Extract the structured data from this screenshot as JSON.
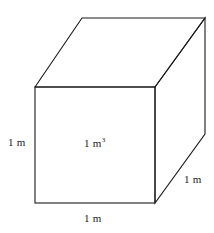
{
  "figure": {
    "kind": "cube-diagram",
    "background_color": "#ffffff",
    "stroke_color": "#1a1a1a",
    "stroke_width": 1.1,
    "fill_color": "none",
    "width": 214,
    "height": 233
  },
  "labels": {
    "left_edge": "1 m",
    "bottom_edge": "1 m",
    "right_edge": "1 m",
    "volume_value": "1 m",
    "volume_exponent": "3"
  },
  "geometry": {
    "front_top_left": [
      35,
      87
    ],
    "front_top_right": [
      155,
      87
    ],
    "front_bottom_right": [
      155,
      203
    ],
    "front_bottom_left": [
      35,
      203
    ],
    "back_top_left": [
      82,
      18
    ],
    "back_top_right": [
      205,
      18
    ],
    "back_bottom_right": [
      205,
      134
    ]
  }
}
